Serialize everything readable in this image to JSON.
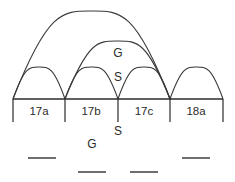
{
  "diagram": {
    "baseline": {
      "y": 99,
      "x_start": 13,
      "x_end": 223
    },
    "segments": [
      {
        "id": "seg-17a",
        "label": "17a",
        "x_start": 13,
        "x_end": 65,
        "label_x": 39,
        "label_y": 115
      },
      {
        "id": "seg-17b",
        "label": "17b",
        "x_start": 65,
        "x_end": 118,
        "label_x": 91,
        "label_y": 115
      },
      {
        "id": "seg-17c",
        "label": "17c",
        "x_start": 118,
        "x_end": 170,
        "label_x": 144,
        "label_y": 115
      },
      {
        "id": "seg-18a",
        "label": "18a",
        "x_start": 170,
        "x_end": 223,
        "label_x": 196,
        "label_y": 115
      }
    ],
    "ticks": [
      {
        "id": "tick-0",
        "x": 13,
        "y_top": 99,
        "y_bottom": 122
      },
      {
        "id": "tick-1",
        "x": 65,
        "y_top": 99,
        "y_bottom": 122
      },
      {
        "id": "tick-2",
        "x": 118,
        "y_top": 99,
        "y_bottom": 122
      },
      {
        "id": "tick-3",
        "x": 170,
        "y_top": 99,
        "y_bottom": 122
      },
      {
        "id": "tick-4",
        "x": 223,
        "y_top": 99,
        "y_bottom": 122
      }
    ],
    "arcs": [
      {
        "id": "arc-17a",
        "x_start": 13,
        "x_end": 65,
        "apex_y": 67,
        "spans": [
          "17a"
        ]
      },
      {
        "id": "arc-17b",
        "x_start": 65,
        "x_end": 118,
        "apex_y": 67,
        "spans": [
          "17b"
        ]
      },
      {
        "id": "arc-17c",
        "x_start": 118,
        "x_end": 170,
        "apex_y": 67,
        "spans": [
          "17c"
        ]
      },
      {
        "id": "arc-18a",
        "x_start": 170,
        "x_end": 223,
        "apex_y": 67,
        "spans": [
          "18a"
        ]
      },
      {
        "id": "arc-17b-17c",
        "x_start": 65,
        "x_end": 170,
        "apex_y": 41,
        "spans": [
          "17b",
          "17c"
        ]
      },
      {
        "id": "arc-17a-17c",
        "x_start": 13,
        "x_end": 170,
        "apex_y": 11,
        "spans": [
          "17a",
          "17b",
          "17c"
        ]
      }
    ],
    "annotations": [
      {
        "id": "label-g-upper",
        "text": "G",
        "x": 118,
        "y": 57
      },
      {
        "id": "label-s-upper",
        "text": "S",
        "x": 118,
        "y": 81
      },
      {
        "id": "label-s-lower",
        "text": "S",
        "x": 118,
        "y": 135
      },
      {
        "id": "label-g-lower",
        "text": "G",
        "x": 92,
        "y": 148
      }
    ],
    "dashes": [
      {
        "id": "dash-1",
        "x_start": 28,
        "x_end": 56,
        "y": 158
      },
      {
        "id": "dash-2",
        "x_start": 78,
        "x_end": 106,
        "y": 172
      },
      {
        "id": "dash-3",
        "x_start": 130,
        "x_end": 158,
        "y": 172
      },
      {
        "id": "dash-4",
        "x_start": 182,
        "x_end": 210,
        "y": 158
      }
    ],
    "colors": {
      "stroke": "#3a3a3a",
      "axis": "#2b2b2b",
      "text": "#2b2b2b",
      "dash": "#4a4a4a",
      "background": "#ffffff"
    }
  }
}
